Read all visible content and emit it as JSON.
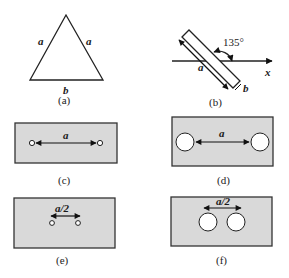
{
  "figure": {
    "panels": [
      {
        "id": "a",
        "caption": "(a)",
        "description": "Isosceles triangle with two equal sides and a base",
        "labels": {
          "left_side": "a",
          "right_side": "a",
          "base": "b"
        }
      },
      {
        "id": "b",
        "caption": "(b)",
        "description": "Tilted rectangular bar crossing x-axis at an angle",
        "labels": {
          "angle": "135°",
          "length": "a",
          "width": "b",
          "axis": "x"
        }
      },
      {
        "id": "c",
        "caption": "(c)",
        "description": "Gray plate with two small holes separated by distance a",
        "labels": {
          "distance": "a"
        }
      },
      {
        "id": "d",
        "caption": "(d)",
        "description": "Gray plate with two large holes separated by distance a",
        "labels": {
          "distance": "a"
        }
      },
      {
        "id": "e",
        "caption": "(e)",
        "description": "Gray plate with two small holes separated by distance a/2",
        "labels": {
          "distance": "a/2"
        }
      },
      {
        "id": "f",
        "caption": "(f)",
        "description": "Gray plate with two large holes separated by distance a/2",
        "labels": {
          "distance": "a/2"
        }
      }
    ],
    "colors": {
      "plate_fill": "#d9d9d9",
      "stroke": "#222222",
      "hole_fill": "#ffffff"
    }
  }
}
